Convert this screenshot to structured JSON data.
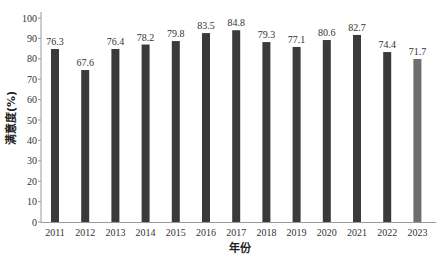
{
  "chart_data": {
    "type": "bar",
    "title": "",
    "xlabel": "年份",
    "ylabel": "满意度(%)",
    "ylim": [
      0,
      100
    ],
    "yticks": [
      0,
      10,
      20,
      30,
      40,
      50,
      60,
      70,
      80,
      90,
      100
    ],
    "grid": false,
    "legend": null,
    "categories": [
      "2011",
      "2012",
      "2013",
      "2014",
      "2015",
      "2016",
      "2017",
      "2018",
      "2019",
      "2020",
      "2021",
      "2022",
      "2023"
    ],
    "values": [
      76.3,
      67.6,
      76.4,
      78.2,
      79.8,
      83.5,
      84.8,
      79.3,
      77.1,
      80.6,
      82.7,
      74.4,
      71.7
    ],
    "data_labels": [
      "76.3",
      "67.6",
      "76.4",
      "78.2",
      "79.8",
      "83.5",
      "84.8",
      "79.3",
      "77.1",
      "80.6",
      "82.7",
      "74.4",
      "71.7"
    ],
    "drawn_bar_heights": [
      84.8,
      74.5,
      84.8,
      87.0,
      88.7,
      92.6,
      94.0,
      88.2,
      85.8,
      89.2,
      91.7,
      83.3,
      79.9
    ],
    "bar_colors": [
      "#3a3a3a",
      "#3a3a3a",
      "#3a3a3a",
      "#3a3a3a",
      "#3a3a3a",
      "#3a3a3a",
      "#3a3a3a",
      "#3a3a3a",
      "#3a3a3a",
      "#3a3a3a",
      "#3a3a3a",
      "#3a3a3a",
      "#6e6e6e"
    ]
  },
  "colors": {
    "axis": "#9a9a9a",
    "bar": "#3a3a3a",
    "bar_highlight": "#6e6e6e"
  }
}
